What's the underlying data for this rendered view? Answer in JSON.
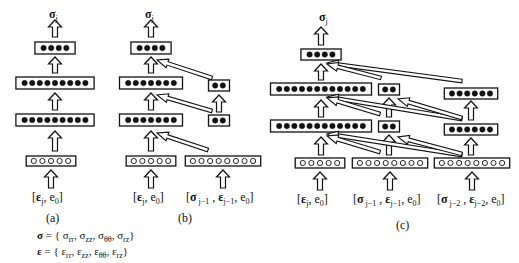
{
  "figure": {
    "panels": [
      {
        "id": "a",
        "caption": "(a)",
        "output_label": "σ",
        "output_sub": "j",
        "columns": [
          {
            "input_label": "[ε_j, e_0]",
            "input_nodes": 5,
            "hidden_layers": [
              9,
              9
            ],
            "output_nodes": 4
          }
        ]
      },
      {
        "id": "b",
        "caption": "(b)",
        "output_label": "σ",
        "output_sub": "j",
        "columns": [
          {
            "input_label": "[ε_j, e_0]",
            "input_nodes": 5,
            "hidden_layers": [
              7,
              7
            ],
            "output_nodes": 4
          },
          {
            "input_label": "[σ_j−1, ε_j−1, e_0]",
            "input_nodes": 8,
            "hidden_layers": [
              2,
              2
            ]
          }
        ]
      },
      {
        "id": "c",
        "caption": "(c)",
        "output_label": "σ",
        "output_sub": "j",
        "columns": [
          {
            "input_label": "[ε_j, e_0]",
            "input_nodes": 5,
            "hidden_layers": [
              12,
              12
            ],
            "output_nodes": 4
          },
          {
            "input_label": "[σ_j−1, ε_j−1, e_0]",
            "input_nodes": 8,
            "hidden_layers": [
              2,
              2
            ]
          },
          {
            "input_label": "[σ_j−2, ε_j−2, e_0]",
            "input_nodes": 8,
            "hidden_layers": [
              6,
              6
            ]
          }
        ]
      }
    ],
    "labels": {
      "sigma": "σ",
      "j": "j",
      "a_caption": "(a)",
      "b_caption": "(b)",
      "c_caption": "(c)",
      "in_eps_j": {
        "open": "[",
        "eps": "ε",
        "sub": "j",
        "rest": ", e",
        "sub0": "0",
        "close": "]"
      },
      "in_jm1": {
        "open": "[",
        "sig": "σ",
        "sub": " j−1",
        "sep": " , ",
        "eps": "ε",
        "esub": "j−1",
        "rest": ", e",
        "sub0": "0",
        "close": "]"
      },
      "in_jm2": {
        "open": "[",
        "sig": "σ",
        "sub": " j−2",
        "sep": " , ",
        "eps": "ε",
        "esub": "j−2",
        "rest": ", e",
        "sub0": "0",
        "close": "]"
      }
    },
    "equations": {
      "sigma_def": {
        "lhs": "σ",
        "eq": " = { ",
        "c1": "σ",
        "s1": "rr",
        "c2": "σ",
        "s2": "zz",
        "c3": "σ",
        "s3": "θθ",
        "c4": "σ",
        "s4": "rz",
        "close": "}"
      },
      "eps_def": {
        "lhs": "ε",
        "eq": " = { ",
        "c1": "ε",
        "s1": "rr",
        "c2": "ε",
        "s2": "zz",
        "c3": "ε",
        "s3": "θθ",
        "c4": "ε",
        "s4": "rz",
        "close": "}"
      }
    },
    "colors": {
      "ink": "#111111",
      "background": "#ffffff"
    }
  }
}
